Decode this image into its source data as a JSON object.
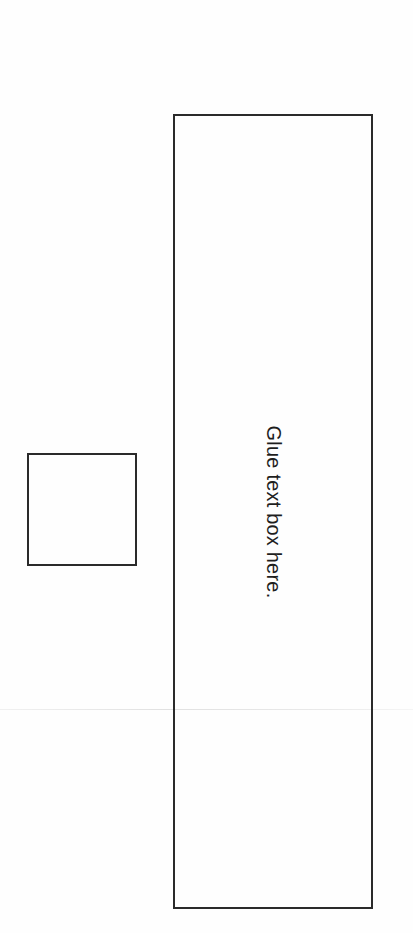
{
  "worksheet": {
    "glue_box": {
      "label": "Glue text box here."
    },
    "small_box": {
      "label": ""
    }
  }
}
